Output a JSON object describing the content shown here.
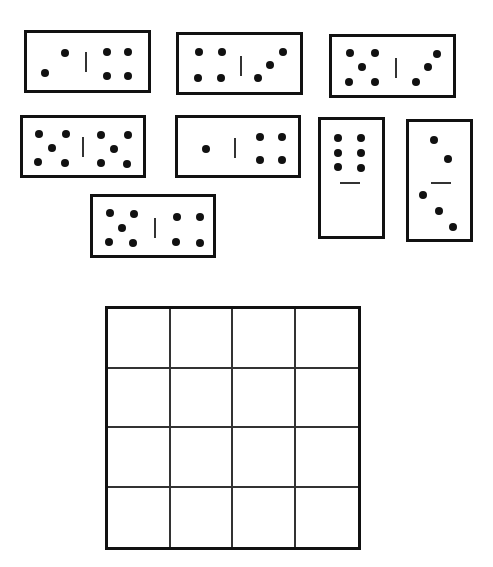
{
  "puzzle": {
    "dominoes": [
      {
        "id": "d1",
        "left": 2,
        "right": 4,
        "orientation": "horizontal"
      },
      {
        "id": "d2",
        "left": 4,
        "right": 3,
        "orientation": "horizontal"
      },
      {
        "id": "d3",
        "left": 5,
        "right": 3,
        "orientation": "horizontal"
      },
      {
        "id": "d4",
        "left": 5,
        "right": 5,
        "orientation": "horizontal"
      },
      {
        "id": "d5",
        "left": 1,
        "right": 4,
        "orientation": "horizontal"
      },
      {
        "id": "d6",
        "top": 6,
        "bottom": 0,
        "orientation": "vertical"
      },
      {
        "id": "d7",
        "top": 2,
        "bottom": 3,
        "orientation": "vertical"
      },
      {
        "id": "d8",
        "left": 5,
        "right": 4,
        "orientation": "horizontal"
      }
    ],
    "grid": {
      "rows": 4,
      "cols": 4,
      "filled": []
    }
  },
  "colors": {
    "ink": "#111111",
    "background": "#ffffff"
  }
}
